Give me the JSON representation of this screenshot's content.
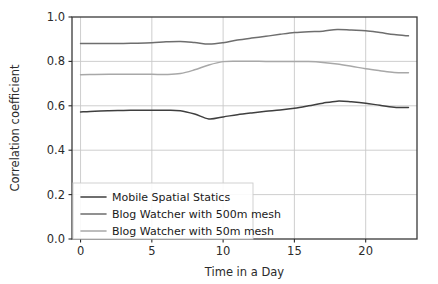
{
  "chart_data": {
    "type": "line",
    "title": "",
    "xlabel": "Time in a Day",
    "ylabel": "Correlation coefficient",
    "xlim": [
      -0.6,
      23.6
    ],
    "ylim": [
      0.0,
      1.0
    ],
    "xticks": [
      0,
      5,
      10,
      15,
      20
    ],
    "xticklabels": [
      "0",
      "5",
      "10",
      "15",
      "20"
    ],
    "yticks": [
      0.0,
      0.2,
      0.4,
      0.6,
      0.8,
      1.0
    ],
    "yticklabels": [
      "0.0",
      "0.2",
      "0.4",
      "0.6",
      "0.8",
      "1.0"
    ],
    "grid": true,
    "grid_color": "#c8c8c8",
    "legend_position": "lower left",
    "x": [
      0,
      1,
      2,
      3,
      4,
      5,
      6,
      7,
      8,
      9,
      10,
      11,
      12,
      13,
      14,
      15,
      16,
      17,
      18,
      19,
      20,
      21,
      22,
      23
    ],
    "series": [
      {
        "name": "Mobile Spatial Statics",
        "color": "#3f3f3f",
        "values": [
          0.572,
          0.576,
          0.578,
          0.579,
          0.58,
          0.58,
          0.58,
          0.578,
          0.563,
          0.541,
          0.55,
          0.56,
          0.568,
          0.575,
          0.581,
          0.589,
          0.6,
          0.612,
          0.621,
          0.618,
          0.612,
          0.602,
          0.594,
          0.592
        ]
      },
      {
        "name": "Blog Watcher with 500m mesh",
        "color": "#6e6e6e",
        "values": [
          0.881,
          0.881,
          0.881,
          0.881,
          0.882,
          0.884,
          0.888,
          0.89,
          0.885,
          0.878,
          0.884,
          0.896,
          0.905,
          0.913,
          0.922,
          0.93,
          0.934,
          0.936,
          0.944,
          0.941,
          0.938,
          0.93,
          0.921,
          0.915
        ]
      },
      {
        "name": "Blog Watcher with 50m mesh",
        "color": "#a8a8a8",
        "values": [
          0.74,
          0.741,
          0.742,
          0.742,
          0.742,
          0.742,
          0.741,
          0.745,
          0.762,
          0.784,
          0.799,
          0.801,
          0.801,
          0.8,
          0.8,
          0.8,
          0.799,
          0.795,
          0.788,
          0.778,
          0.767,
          0.758,
          0.75,
          0.749
        ]
      }
    ]
  },
  "axes": {
    "ylabel": "Correlation coefficient",
    "xlabel": "Time in a Day"
  },
  "legend": {
    "entries": [
      {
        "label": "Mobile Spatial Statics"
      },
      {
        "label": "Blog Watcher with 500m mesh"
      },
      {
        "label": "Blog Watcher with 50m mesh"
      }
    ]
  },
  "colors": {
    "background": "#ffffff",
    "axis": "#3a3a3a",
    "grid": "#c8c8c8",
    "text": "#2b2b2b",
    "legend_border": "#cccccc"
  }
}
